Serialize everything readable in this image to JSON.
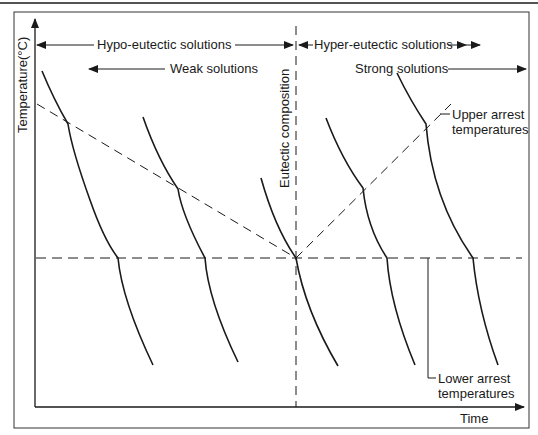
{
  "diagram": {
    "type": "cooling curves / eutectic diagram",
    "axes": {
      "y_label": "Temperature(°C)",
      "x_label": "Time"
    },
    "range_labels": {
      "hypo": "Hypo-eutectic solutions",
      "hyper": "Hyper-eutectic solutions",
      "weak": "Weak solutions",
      "strong": "Strong solutions"
    },
    "eutectic_label": "Eutectic composition",
    "annotations": {
      "upper": "Upper arrest temperatures",
      "upper_line1": "Upper arrest",
      "upper_line2": "temperatures",
      "lower": "Lower arrest temperatures",
      "lower_line1": "Lower arrest",
      "lower_line2": "temperatures"
    },
    "colors": {
      "line": "#1a1a1a",
      "background": "#ffffff"
    },
    "curves": [
      {
        "name": "hypo-weak-1",
        "upper_arrest": true,
        "lower_arrest": true
      },
      {
        "name": "hypo-weak-2",
        "upper_arrest": true,
        "lower_arrest": true
      },
      {
        "name": "eutectic",
        "upper_arrest": false,
        "lower_arrest": true
      },
      {
        "name": "hyper-1",
        "upper_arrest": true,
        "lower_arrest": true
      },
      {
        "name": "hyper-strong-2",
        "upper_arrest": true,
        "lower_arrest": true
      }
    ]
  }
}
